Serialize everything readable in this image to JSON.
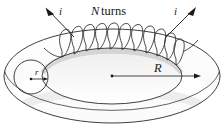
{
  "figure": {
    "name": "toroid-diagram",
    "labels": {
      "turns_symbol": "N",
      "turns_word": "turns",
      "current_left": "i",
      "current_right": "i",
      "major_radius": "R",
      "minor_radius": "r"
    },
    "colors": {
      "stroke": "#1a1a1a",
      "torus_fill": "#ffffff",
      "shade_light": "#ededed",
      "shade_mid": "#e0e0e0",
      "shade_dark": "#d2d2d2",
      "background": "#ffffff"
    },
    "geometry": {
      "outer_ellipse": {
        "cx": 112,
        "cy": 76,
        "rx": 108,
        "ry": 47
      },
      "inner_ellipse": {
        "cx": 112,
        "cy": 76,
        "rx": 70,
        "ry": 28
      },
      "cross_section_circle": {
        "cx": 31,
        "cy": 77,
        "r": 17
      },
      "center_dot": {
        "cx": 112,
        "cy": 76
      },
      "coil_turn_count": 11
    }
  }
}
